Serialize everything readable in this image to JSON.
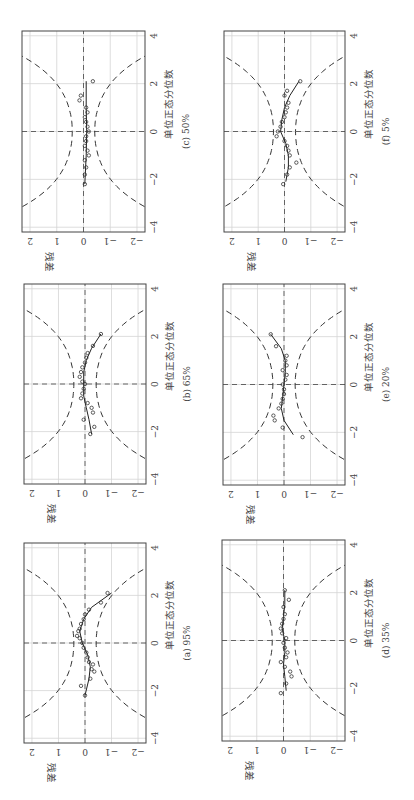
{
  "figure": {
    "rotation_deg": -90,
    "width": 800,
    "height": 414
  },
  "chart_data": [
    {
      "type": "scatter",
      "panel": "a",
      "caption": "(a) 95%",
      "xlabel": "单位正态分位数",
      "ylabel": "残差",
      "xlim": [
        -4.2,
        4.2
      ],
      "ylim": [
        -2.3,
        2.3
      ],
      "xticks": [
        -4,
        -2,
        0,
        2,
        4
      ],
      "yticks": [
        -2,
        -1,
        0,
        1,
        2
      ],
      "points": [
        [
          -2.2,
          0.0
        ],
        [
          -1.8,
          0.15
        ],
        [
          -1.5,
          -0.2
        ],
        [
          -1.2,
          -0.35
        ],
        [
          -1.1,
          -0.25
        ],
        [
          -0.9,
          -0.3
        ],
        [
          -0.8,
          -0.15
        ],
        [
          -0.6,
          -0.1
        ],
        [
          -0.4,
          -0.05
        ],
        [
          -0.2,
          0.05
        ],
        [
          0.0,
          0.1
        ],
        [
          0.2,
          0.2
        ],
        [
          0.3,
          0.3
        ],
        [
          0.5,
          0.25
        ],
        [
          0.6,
          0.2
        ],
        [
          0.8,
          0.15
        ],
        [
          1.0,
          0.05
        ],
        [
          1.2,
          0.0
        ],
        [
          1.4,
          -0.15
        ],
        [
          1.7,
          -0.6
        ],
        [
          2.1,
          -0.85
        ]
      ],
      "fit": [
        [
          -2.2,
          0.0
        ],
        [
          -1.5,
          -0.15
        ],
        [
          -1.0,
          -0.2
        ],
        [
          -0.5,
          -0.1
        ],
        [
          0.0,
          0.1
        ],
        [
          0.5,
          0.2
        ],
        [
          1.0,
          0.05
        ],
        [
          1.5,
          -0.25
        ],
        [
          2.1,
          -1.0
        ]
      ]
    },
    {
      "type": "scatter",
      "panel": "b",
      "caption": "(b) 65%",
      "xlabel": "单位正态分位数",
      "ylabel": "残差",
      "xlim": [
        -4.2,
        4.2
      ],
      "ylim": [
        -2.3,
        2.3
      ],
      "xticks": [
        -4,
        -2,
        0,
        2,
        4
      ],
      "yticks": [
        -2,
        -1,
        0,
        1,
        2
      ],
      "points": [
        [
          -2.1,
          -0.2
        ],
        [
          -1.8,
          -0.35
        ],
        [
          -1.5,
          0.05
        ],
        [
          -1.2,
          -0.3
        ],
        [
          -1.0,
          -0.25
        ],
        [
          -0.8,
          -0.1
        ],
        [
          -0.6,
          0.15
        ],
        [
          -0.4,
          0.1
        ],
        [
          -0.2,
          0.05
        ],
        [
          0.0,
          0.0
        ],
        [
          0.1,
          0.1
        ],
        [
          0.3,
          0.2
        ],
        [
          0.5,
          0.15
        ],
        [
          0.7,
          0.1
        ],
        [
          0.9,
          0.0
        ],
        [
          1.1,
          -0.05
        ],
        [
          1.3,
          -0.1
        ],
        [
          1.6,
          -0.3
        ],
        [
          2.1,
          -0.6
        ]
      ],
      "fit": [
        [
          -2.1,
          -0.25
        ],
        [
          -1.5,
          -0.15
        ],
        [
          -1.0,
          -0.05
        ],
        [
          -0.5,
          0.05
        ],
        [
          0.0,
          0.05
        ],
        [
          0.5,
          0.05
        ],
        [
          1.0,
          -0.05
        ],
        [
          1.5,
          -0.25
        ],
        [
          2.1,
          -0.6
        ]
      ]
    },
    {
      "type": "scatter",
      "panel": "c",
      "caption": "(c) 50%",
      "xlabel": "单位正态分位数",
      "ylabel": "残差",
      "xlim": [
        -4.2,
        4.2
      ],
      "ylim": [
        -2.3,
        2.3
      ],
      "xticks": [
        -4,
        -2,
        0,
        2,
        4
      ],
      "yticks": [
        -2,
        -1,
        0,
        1,
        2
      ],
      "points": [
        [
          -2.2,
          -0.05
        ],
        [
          -1.8,
          -0.05
        ],
        [
          -1.5,
          -0.1
        ],
        [
          -1.2,
          -0.05
        ],
        [
          -1.0,
          -0.2
        ],
        [
          -0.8,
          -0.15
        ],
        [
          -0.6,
          -0.05
        ],
        [
          -0.4,
          -0.1
        ],
        [
          -0.2,
          -0.1
        ],
        [
          0.0,
          -0.2
        ],
        [
          0.2,
          -0.15
        ],
        [
          0.4,
          -0.1
        ],
        [
          0.6,
          -0.05
        ],
        [
          0.8,
          -0.15
        ],
        [
          1.0,
          -0.1
        ],
        [
          1.3,
          0.15
        ],
        [
          1.5,
          0.1
        ],
        [
          2.1,
          -0.35
        ]
      ],
      "fit": [
        [
          -2.2,
          -0.05
        ],
        [
          -1.0,
          -0.1
        ],
        [
          0.0,
          -0.12
        ],
        [
          1.0,
          -0.1
        ],
        [
          2.1,
          -0.1
        ]
      ]
    },
    {
      "type": "scatter",
      "panel": "d",
      "caption": "(d) 35%",
      "xlabel": "单位正态分位数",
      "ylabel": "残差",
      "xlim": [
        -4.2,
        4.2
      ],
      "ylim": [
        -2.3,
        2.3
      ],
      "xticks": [
        -4,
        -2,
        0,
        2,
        4
      ],
      "yticks": [
        -2,
        -1,
        0,
        1,
        2
      ],
      "points": [
        [
          -2.2,
          0.1
        ],
        [
          -1.8,
          -0.1
        ],
        [
          -1.5,
          -0.3
        ],
        [
          -1.3,
          -0.25
        ],
        [
          -1.1,
          -0.05
        ],
        [
          -0.9,
          0.1
        ],
        [
          -0.7,
          -0.1
        ],
        [
          -0.5,
          -0.15
        ],
        [
          -0.3,
          -0.05
        ],
        [
          -0.1,
          0.0
        ],
        [
          0.1,
          -0.1
        ],
        [
          0.3,
          0.05
        ],
        [
          0.5,
          0.1
        ],
        [
          0.7,
          0.05
        ],
        [
          0.9,
          0.0
        ],
        [
          1.1,
          -0.05
        ],
        [
          1.4,
          0.0
        ],
        [
          1.7,
          -0.2
        ],
        [
          2.1,
          -0.05
        ]
      ],
      "fit": [
        [
          -2.1,
          -0.1
        ],
        [
          -1.5,
          -0.05
        ],
        [
          -1.0,
          0.0
        ],
        [
          -0.5,
          -0.05
        ],
        [
          0.0,
          -0.05
        ],
        [
          0.5,
          0.05
        ],
        [
          1.0,
          0.0
        ],
        [
          1.5,
          -0.05
        ],
        [
          2.1,
          -0.05
        ]
      ]
    },
    {
      "type": "scatter",
      "panel": "e",
      "caption": "(e) 20%",
      "xlabel": "单位正态分位数",
      "ylabel": "残差",
      "xlim": [
        -4.2,
        4.2
      ],
      "ylim": [
        -2.3,
        2.3
      ],
      "xticks": [
        -4,
        -2,
        0,
        2,
        4
      ],
      "yticks": [
        -2,
        -1,
        0,
        1,
        2
      ],
      "points": [
        [
          -2.2,
          -0.7
        ],
        [
          -1.8,
          0.05
        ],
        [
          -1.5,
          0.35
        ],
        [
          -1.3,
          0.4
        ],
        [
          -1.0,
          0.2
        ],
        [
          -0.8,
          0.1
        ],
        [
          -0.6,
          0.05
        ],
        [
          -0.4,
          0.0
        ],
        [
          -0.2,
          0.0
        ],
        [
          0.0,
          0.05
        ],
        [
          0.2,
          -0.05
        ],
        [
          0.4,
          -0.1
        ],
        [
          0.6,
          0.05
        ],
        [
          0.8,
          -0.1
        ],
        [
          1.0,
          -0.05
        ],
        [
          1.2,
          -0.1
        ],
        [
          1.6,
          0.3
        ],
        [
          2.1,
          0.5
        ]
      ],
      "fit": [
        [
          -2.1,
          -0.35
        ],
        [
          -1.5,
          0.0
        ],
        [
          -1.0,
          0.1
        ],
        [
          -0.5,
          0.05
        ],
        [
          0.0,
          0.0
        ],
        [
          0.5,
          -0.05
        ],
        [
          1.0,
          -0.05
        ],
        [
          1.5,
          0.1
        ],
        [
          2.1,
          0.5
        ]
      ]
    },
    {
      "type": "scatter",
      "panel": "f",
      "caption": "(f) 5%",
      "xlabel": "单位正态分位数",
      "ylabel": "残差",
      "xlim": [
        -4.2,
        4.2
      ],
      "ylim": [
        -2.3,
        2.3
      ],
      "xticks": [
        -4,
        -2,
        0,
        2,
        4
      ],
      "yticks": [
        -2,
        -1,
        0,
        1,
        2
      ],
      "points": [
        [
          -2.2,
          0.05
        ],
        [
          -1.8,
          -0.1
        ],
        [
          -1.5,
          -0.2
        ],
        [
          -1.3,
          -0.45
        ],
        [
          -1.0,
          -0.2
        ],
        [
          -0.8,
          -0.15
        ],
        [
          -0.6,
          -0.1
        ],
        [
          -0.4,
          0.0
        ],
        [
          -0.2,
          0.3
        ],
        [
          0.0,
          0.25
        ],
        [
          0.2,
          0.15
        ],
        [
          0.4,
          0.1
        ],
        [
          0.6,
          0.0
        ],
        [
          0.8,
          -0.05
        ],
        [
          1.0,
          -0.1
        ],
        [
          1.2,
          -0.15
        ],
        [
          1.5,
          0.0
        ],
        [
          1.7,
          -0.1
        ],
        [
          2.1,
          -0.6
        ]
      ],
      "fit": [
        [
          -2.1,
          -0.05
        ],
        [
          -1.5,
          -0.15
        ],
        [
          -1.0,
          -0.15
        ],
        [
          -0.5,
          -0.05
        ],
        [
          0.0,
          0.15
        ],
        [
          0.5,
          0.1
        ],
        [
          1.0,
          0.0
        ],
        [
          1.5,
          -0.2
        ],
        [
          2.1,
          -0.55
        ]
      ]
    }
  ],
  "panels_layout": [
    {
      "panel": "a",
      "u0": 57,
      "u1": 257,
      "v0": 24,
      "v1": 146
    },
    {
      "panel": "b",
      "u0": 316,
      "u1": 516,
      "v0": 24,
      "v1": 146
    },
    {
      "panel": "c",
      "u0": 568,
      "u1": 769,
      "v0": 22,
      "v1": 145
    },
    {
      "panel": "d",
      "u0": 59,
      "u1": 260,
      "v0": 222,
      "v1": 345
    },
    {
      "panel": "e",
      "u0": 315,
      "u1": 516,
      "v0": 223,
      "v1": 345
    },
    {
      "panel": "f",
      "u0": 568,
      "u1": 769,
      "v0": 224,
      "v1": 345
    }
  ]
}
